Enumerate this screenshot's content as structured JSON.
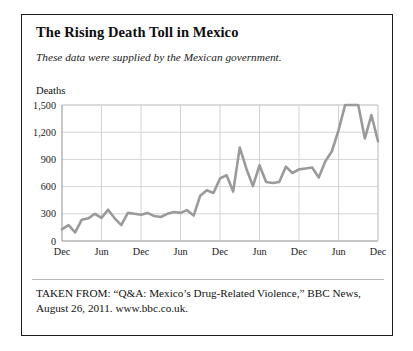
{
  "figure": {
    "title": "The Rising Death Toll in Mexico",
    "subtitle": "These data were supplied by the Mexican government.",
    "caption": "TAKEN FROM: “Q&A: Mexico’s Drug-Related Violence,” BBC News, August 26, 2011. www.bbc.co.uk.",
    "border_color": "#1b1b1b"
  },
  "chart_data": {
    "type": "line",
    "title": "The Rising Death Toll in Mexico",
    "subtitle": "These data were supplied by the Mexican government.",
    "xlabel": "",
    "ylabel": "Deaths",
    "ylim": [
      0,
      1500
    ],
    "yticks": [
      0,
      300,
      600,
      900,
      1200,
      1500
    ],
    "ytick_labels": [
      "0",
      "300",
      "600",
      "900",
      "1,200",
      "1,500"
    ],
    "xtick_labels": [
      "Dec",
      "Jun",
      "Dec",
      "Jun",
      "Dec",
      "Jun",
      "Dec",
      "Jun",
      "Dec"
    ],
    "xtick_years": [
      "",
      "2007",
      "",
      "2008",
      "",
      "2009",
      "",
      "2010",
      ""
    ],
    "xtick_index": [
      0,
      6,
      12,
      18,
      24,
      30,
      36,
      42,
      48
    ],
    "grid": true,
    "legend": false,
    "line_color": "#9a9a9a",
    "grid_color": "#c9c9c9",
    "axis_color": "#8f8f8f",
    "series": [
      {
        "name": "Deaths",
        "values": [
          130,
          175,
          95,
          235,
          250,
          300,
          255,
          345,
          250,
          175,
          310,
          300,
          290,
          310,
          275,
          265,
          300,
          320,
          310,
          340,
          280,
          500,
          560,
          530,
          690,
          725,
          545,
          1030,
          800,
          605,
          835,
          650,
          640,
          650,
          820,
          750,
          790,
          800,
          810,
          700,
          880,
          990,
          1220,
          1500,
          1500,
          1500,
          1130,
          1390,
          1100
        ]
      }
    ]
  }
}
